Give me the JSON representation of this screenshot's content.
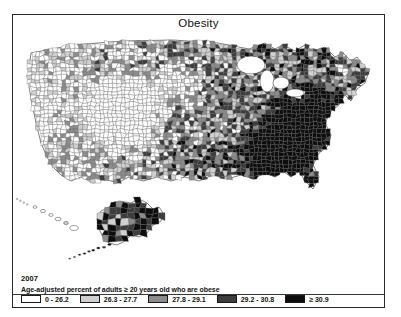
{
  "figure": {
    "title": "Obesity",
    "year": "2007",
    "legend_title": "Age-adjusted percent of adults ≥ 20 years old who are obese",
    "legend": [
      {
        "label": "0 - 26.2",
        "color": "#ffffff"
      },
      {
        "label": "26.3 - 27.7",
        "color": "#d0d0d0"
      },
      {
        "label": "27.8 - 29.1",
        "color": "#8c8c8c"
      },
      {
        "label": "29.2 - 30.8",
        "color": "#3d3d3d"
      },
      {
        "label": "≥ 30.9",
        "color": "#0d0d0d"
      }
    ],
    "border_color": "#2b2b2b",
    "county_outline_color": "#5a5a5a"
  },
  "chart_data": {
    "type": "heatmap",
    "title": "Obesity",
    "subtitle": "Age-adjusted percent of adults ≥ 20 years old who are obese",
    "year": "2007",
    "geography": "United States counties (lower 48, Alaska and Hawaii insets)",
    "xlabel": "",
    "ylabel": "",
    "legend_position": "bottom",
    "grid": false,
    "bins": [
      {
        "label": "0 - 26.2",
        "min": 0,
        "max": 26.2,
        "color": "#ffffff"
      },
      {
        "label": "26.3 - 27.7",
        "min": 26.3,
        "max": 27.7,
        "color": "#d0d0d0"
      },
      {
        "label": "27.8 - 29.1",
        "min": 27.8,
        "max": 29.1,
        "color": "#8c8c8c"
      },
      {
        "label": "29.2 - 30.8",
        "min": 29.2,
        "max": 30.8,
        "color": "#3d3d3d"
      },
      {
        "label": "≥ 30.9",
        "min": 30.9,
        "max": 100,
        "color": "#0d0d0d"
      }
    ],
    "categories": [
      "0 - 26.2",
      "26.3 - 27.7",
      "27.8 - 29.1",
      "29.2 - 30.8",
      "≥ 30.9"
    ],
    "values": [
      620,
      560,
      640,
      700,
      620
    ],
    "regional_summary": [
      {
        "region": "Mountain West / Colorado",
        "typical_bin": "0 - 26.2"
      },
      {
        "region": "Upper Plains (Dakotas, Nebraska, Kansas)",
        "typical_bin": "0 - 26.2"
      },
      {
        "region": "Pacific Northwest",
        "typical_bin": "26.3 - 27.7"
      },
      {
        "region": "California",
        "typical_bin": "26.3 - 27.7"
      },
      {
        "region": "Texas",
        "typical_bin": "27.8 - 29.1"
      },
      {
        "region": "Upper Midwest",
        "typical_bin": "27.8 - 29.1"
      },
      {
        "region": "Appalachia / Ohio Valley",
        "typical_bin": "29.2 - 30.8"
      },
      {
        "region": "Deep South (Mississippi, Alabama, Louisiana, Georgia)",
        "typical_bin": "≥ 30.9"
      },
      {
        "region": "Northeast / New England",
        "typical_bin": "26.3 - 27.7"
      },
      {
        "region": "Alaska",
        "typical_bin": "29.2 - 30.8"
      },
      {
        "region": "Hawaii",
        "typical_bin": "0 - 26.2"
      }
    ]
  }
}
